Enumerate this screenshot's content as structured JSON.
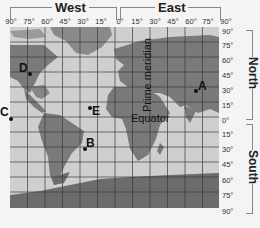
{
  "hemispheres": {
    "west": "West",
    "east": "East",
    "north": "North",
    "south": "South"
  },
  "longitude_labels": [
    "90°",
    "75°",
    "60°",
    "45°",
    "30°",
    "15°",
    "0°",
    "15°",
    "30°",
    "45°",
    "60°",
    "75°",
    "90°"
  ],
  "latitude_labels": [
    "90°",
    "75°",
    "60°",
    "45°",
    "30°",
    "15°",
    "0°",
    "15°",
    "30°",
    "45°",
    "60°",
    "75°",
    "90°"
  ],
  "map_labels": {
    "prime_meridian": "Prime meridian",
    "equator": "Equator"
  },
  "points": [
    {
      "id": "A",
      "label": "A"
    },
    {
      "id": "B",
      "label": "B"
    },
    {
      "id": "C",
      "label": "C"
    },
    {
      "id": "D",
      "label": "D"
    },
    {
      "id": "E",
      "label": "E"
    }
  ],
  "colors": {
    "ocean": "#cfcfcf",
    "land": "#7a7a7a",
    "grid": "#3a3a3a",
    "antarctica": "#6c6c6c"
  }
}
